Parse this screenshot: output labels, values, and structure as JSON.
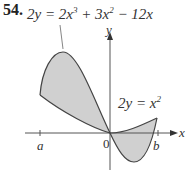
{
  "problem": {
    "number": "54."
  },
  "curves": {
    "cubic_label": {
      "lhs": "2y = 2x",
      "sup1": "3",
      "mid": " + 3x",
      "sup2": "2",
      "rhs": " − 12x"
    },
    "parabola_label": {
      "lhs": "2y = x",
      "sup": "2"
    }
  },
  "axes": {
    "x_label": "x",
    "y_label": "y",
    "origin_label": "0",
    "tick_a": "a",
    "tick_b": "b"
  },
  "colors": {
    "fill": "#d0d0d0",
    "stroke": "#444444",
    "axis": "#555555"
  }
}
